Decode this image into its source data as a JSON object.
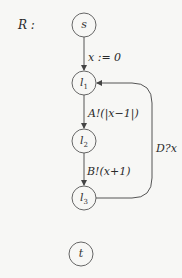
{
  "diagram": {
    "title": "R :",
    "nodes": [
      {
        "id": "s",
        "label": "s",
        "sub": "",
        "cx": 84,
        "cy": 25
      },
      {
        "id": "l1",
        "label": "l",
        "sub": "1",
        "cx": 84,
        "cy": 83
      },
      {
        "id": "l2",
        "label": "l",
        "sub": "2",
        "cx": 84,
        "cy": 141
      },
      {
        "id": "l3",
        "label": "l",
        "sub": "3",
        "cx": 84,
        "cy": 198
      },
      {
        "id": "t",
        "label": "t",
        "sub": "",
        "cx": 81,
        "cy": 254
      }
    ],
    "edges": [
      {
        "from": "s",
        "to": "l1",
        "label": "x := 0"
      },
      {
        "from": "l1",
        "to": "l2",
        "label": "A!(|x−1|)"
      },
      {
        "from": "l2",
        "to": "l3",
        "label": "B!(x+1)"
      },
      {
        "from": "l3",
        "to": "l1",
        "label": "D?x"
      }
    ],
    "colors": {
      "stroke": "#555555",
      "background": "#f7f7f5",
      "text": "#2a2a2a"
    }
  }
}
